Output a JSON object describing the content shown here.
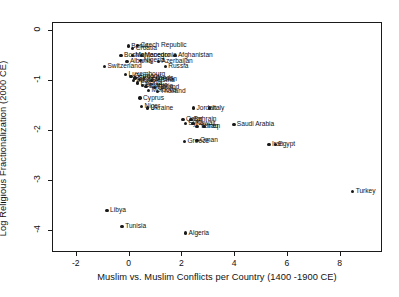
{
  "chart_data": {
    "type": "scatter",
    "title": "",
    "xlabel": "Muslim vs. Muslim Conflicts per Country (1400 -1900 CE)",
    "ylabel": "Log Religious Fractionalization (2000 CE)",
    "xlim": [
      -2.9,
      9.6
    ],
    "ylim": [
      -4.45,
      0.15
    ],
    "xticks": [
      -2,
      0,
      2,
      4,
      6,
      8
    ],
    "xtick_labels": [
      "-2",
      "0",
      "2",
      "4",
      "6",
      "8"
    ],
    "yticks": [
      0,
      -1,
      -2,
      -3,
      -4
    ],
    "ytick_labels": [
      "0",
      "-1",
      "-2",
      "-3",
      "-4"
    ],
    "grid": false,
    "legend": false,
    "marker_color": "#191919",
    "points": [
      {
        "label": "Czech Republic",
        "x": 0.3,
        "y": -0.3
      },
      {
        "label": "Croatia",
        "x": 0.12,
        "y": -0.36
      },
      {
        "label": "Benin",
        "x": -0.05,
        "y": -0.31
      },
      {
        "label": "Bosnia",
        "x": -0.32,
        "y": -0.5
      },
      {
        "label": "Montenegro",
        "x": 0.1,
        "y": -0.5
      },
      {
        "label": "Macedonia",
        "x": 0.45,
        "y": -0.5
      },
      {
        "label": "Afghanistan",
        "x": 1.72,
        "y": -0.5
      },
      {
        "label": "Albania",
        "x": -0.1,
        "y": -0.62
      },
      {
        "label": "Nigeria",
        "x": 0.42,
        "y": -0.6
      },
      {
        "label": "Azerbaijan",
        "x": 1.1,
        "y": -0.62
      },
      {
        "label": "Switzerland",
        "x": -0.95,
        "y": -0.72
      },
      {
        "label": "Russia",
        "x": 1.35,
        "y": -0.72
      },
      {
        "label": "Luxembourg",
        "x": -0.15,
        "y": -0.88
      },
      {
        "label": "Germany",
        "x": 0.05,
        "y": -0.92
      },
      {
        "label": "Netherlands",
        "x": 0.2,
        "y": -0.95
      },
      {
        "label": "Kazakhstan",
        "x": 0.38,
        "y": -0.98
      },
      {
        "label": "Latvia",
        "x": 0.15,
        "y": -1.0
      },
      {
        "label": "Austria",
        "x": 0.82,
        "y": -1.0
      },
      {
        "label": "Estonia",
        "x": 0.3,
        "y": -1.05
      },
      {
        "label": "Belarus",
        "x": 0.48,
        "y": -1.1
      },
      {
        "label": "Bulgaria",
        "x": 0.62,
        "y": -1.12
      },
      {
        "label": "Finland",
        "x": 0.95,
        "y": -1.14
      },
      {
        "label": "Moldova",
        "x": 0.72,
        "y": -1.2
      },
      {
        "label": "Thailand",
        "x": 1.05,
        "y": -1.22
      },
      {
        "label": "Cyprus",
        "x": 0.4,
        "y": -1.35
      },
      {
        "label": "Niger",
        "x": 0.45,
        "y": -1.52
      },
      {
        "label": "Ukraine",
        "x": 0.68,
        "y": -1.55
      },
      {
        "label": "Jordan",
        "x": 2.42,
        "y": -1.55
      },
      {
        "label": "Italy",
        "x": 3.02,
        "y": -1.55
      },
      {
        "label": "Qatar",
        "x": 2.02,
        "y": -1.78
      },
      {
        "label": "Bahrain",
        "x": 2.32,
        "y": -1.78
      },
      {
        "label": "Syria",
        "x": 2.12,
        "y": -1.86
      },
      {
        "label": "Kuwait",
        "x": 2.4,
        "y": -1.86
      },
      {
        "label": "Yemen",
        "x": 2.55,
        "y": -1.92
      },
      {
        "label": "Iraq",
        "x": 2.82,
        "y": -1.92
      },
      {
        "label": "Saudi Arabia",
        "x": 3.95,
        "y": -1.88
      },
      {
        "label": "Greece",
        "x": 2.08,
        "y": -2.22
      },
      {
        "label": "Oman",
        "x": 2.55,
        "y": -2.2
      },
      {
        "label": "Iran",
        "x": 5.28,
        "y": -2.28
      },
      {
        "label": "Egypt",
        "x": 5.52,
        "y": -2.28
      },
      {
        "label": "Turkey",
        "x": 8.45,
        "y": -3.22
      },
      {
        "label": "Libya",
        "x": -0.85,
        "y": -3.6
      },
      {
        "label": "Tunisia",
        "x": -0.28,
        "y": -3.92
      },
      {
        "label": "Algeria",
        "x": 2.12,
        "y": -4.05
      }
    ]
  }
}
